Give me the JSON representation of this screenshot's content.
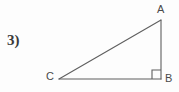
{
  "figure": {
    "problem_number": "3)",
    "shape": "right-triangle",
    "background_color": "#fdfdfd",
    "stroke_color": "#5f5f5f",
    "text_color": "#4a4a4a",
    "vertices": [
      {
        "name": "A",
        "label": "A",
        "x": 161,
        "y": 20
      },
      {
        "name": "B",
        "label": "B",
        "x": 161,
        "y": 79
      },
      {
        "name": "C",
        "label": "C",
        "x": 59,
        "y": 79
      }
    ],
    "edges": [
      {
        "name": "hypotenuse-CA",
        "from": "C",
        "to": "A"
      },
      {
        "name": "leg-AB",
        "from": "A",
        "to": "B"
      },
      {
        "name": "leg-CB",
        "from": "C",
        "to": "B"
      }
    ],
    "right_angle": {
      "at_vertex": "B",
      "marker": "square",
      "size": 9
    }
  }
}
